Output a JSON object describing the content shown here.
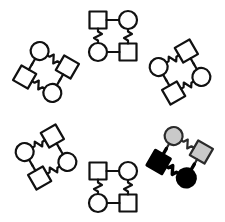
{
  "figure": {
    "width": 225,
    "height": 222,
    "background_color": "#ffffff"
  },
  "palette": {
    "outline": "#111111",
    "node_fill_default": "#ffffff",
    "node_fill_gray": "#c9c9c9",
    "node_fill_black": "#000000",
    "gray_outline": "#2b2b2b"
  },
  "ring": {
    "center_x": 112.5,
    "center_y": 111,
    "radius": 78,
    "cluster_count": 6
  },
  "motif": {
    "node_count": 4,
    "node_types": [
      "square",
      "circle",
      "circle",
      "square"
    ],
    "square_size": 17,
    "circle_radius": 9,
    "stub_length": 7,
    "edge_style": "zigzag",
    "structure": "two square-circle pairs joined by wavy edges, point-mirrored"
  },
  "clusters": [
    {
      "id": "cluster-top",
      "label": "Top motif",
      "position_label": "12 o'clock",
      "center_x": 113,
      "center_y": 36,
      "rotation_deg": 0,
      "fill_style": "outline",
      "highlighted": false
    },
    {
      "id": "cluster-top-right",
      "label": "Top-right motif",
      "position_label": "2 o'clock",
      "center_x": 180,
      "center_y": 72,
      "rotation_deg": 60,
      "fill_style": "outline",
      "highlighted": false
    },
    {
      "id": "cluster-bottom-right",
      "label": "Bottom-right motif",
      "position_label": "4 o'clock",
      "center_x": 180,
      "center_y": 157,
      "rotation_deg": 120,
      "fill_style": "highlight",
      "highlighted": true,
      "highlight_detail": {
        "pair_one_fill": "#c9c9c9",
        "pair_one_label": "gray pair",
        "pair_two_fill": "#000000",
        "pair_two_label": "black pair"
      }
    },
    {
      "id": "cluster-bottom",
      "label": "Bottom motif",
      "position_label": "6 o'clock",
      "center_x": 113,
      "center_y": 187,
      "rotation_deg": 180,
      "fill_style": "outline",
      "highlighted": false
    },
    {
      "id": "cluster-bottom-left",
      "label": "Bottom-left motif",
      "position_label": "8 o'clock",
      "center_x": 46,
      "center_y": 157,
      "rotation_deg": 240,
      "fill_style": "outline",
      "highlighted": false
    },
    {
      "id": "cluster-top-left",
      "label": "Top-left motif",
      "position_label": "10 o'clock",
      "center_x": 46,
      "center_y": 72,
      "rotation_deg": 300,
      "fill_style": "outline",
      "highlighted": false
    }
  ]
}
